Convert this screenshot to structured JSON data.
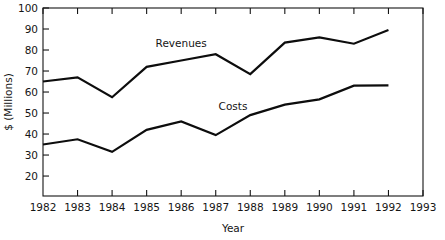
{
  "chart_data": {
    "type": "line",
    "title": "",
    "xlabel": "Year",
    "ylabel": "$ (Millions)",
    "categories": [
      1982,
      1983,
      1984,
      1985,
      1986,
      1987,
      1988,
      1989,
      1990,
      1991,
      1992
    ],
    "x_tick_labels": [
      "1982",
      "1983",
      "1984",
      "1985",
      "1986",
      "1987",
      "1988",
      "1989",
      "1990",
      "1991",
      "1992",
      "1993"
    ],
    "y_tick_labels": [
      "20",
      "30",
      "40",
      "50",
      "60",
      "70",
      "80",
      "90",
      "100"
    ],
    "y_ticks": [
      20,
      30,
      40,
      50,
      60,
      70,
      80,
      90,
      100
    ],
    "xlim": [
      1982,
      1993
    ],
    "ylim": [
      10.5,
      100
    ],
    "grid": false,
    "legend": "inline-labels",
    "frame": "box",
    "line_color": "#0d0d0d",
    "series": [
      {
        "name": "Revenues",
        "label_x": 1986.0,
        "label_y": 81.5,
        "values": [
          65,
          67,
          57.5,
          72,
          75,
          78,
          68.5,
          83.5,
          86,
          83,
          89.5
        ]
      },
      {
        "name": "Costs",
        "label_x": 1987.5,
        "label_y": 51.5,
        "values": [
          35,
          37.5,
          31.5,
          42,
          46,
          39.5,
          49,
          54,
          56.5,
          63,
          63.2
        ]
      }
    ]
  },
  "axis": {
    "x_title": "Year",
    "y_title": "$ (Millions)"
  }
}
